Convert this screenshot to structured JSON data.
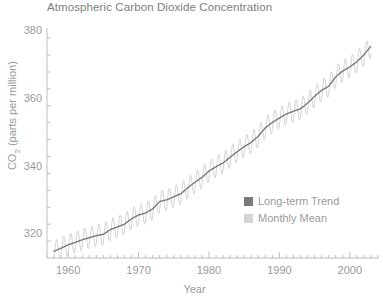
{
  "chart_data": {
    "type": "line",
    "title": "Atmospheric Carbon Dioxide Concentration",
    "xlabel": "Year",
    "ylabel": "CO2 (parts per million)",
    "ylabel_prefix": "CO",
    "ylabel_sub": "2",
    "ylabel_suffix": " (parts per million)",
    "xlim": [
      1957,
      2004
    ],
    "ylim": [
      313,
      381
    ],
    "grid": false,
    "xticks": [
      1960,
      1970,
      1980,
      1990,
      2000
    ],
    "xtick_labels": [
      "1960",
      "1970",
      "1980",
      "1990",
      "2000"
    ],
    "xminor_step": 1,
    "yticks": [
      320,
      340,
      360,
      380
    ],
    "ytick_labels": [
      "320",
      "340",
      "360",
      "380"
    ],
    "yminor_step": 5,
    "legend_position": "center-right-inside",
    "colors": {
      "trend": "#7a7a7a",
      "monthly": "#d4d4d4",
      "axis": "#bdbdbd",
      "text": "#9a9a9a",
      "title": "#7d7d7d",
      "background": "#ffffff"
    },
    "series": [
      {
        "name": "Long-term Trend",
        "swatch_color": "#7a7a7a",
        "x": [
          1958.0,
          1959.0,
          1960.0,
          1961.0,
          1962.0,
          1963.0,
          1964.0,
          1965.0,
          1966.0,
          1967.0,
          1968.0,
          1969.0,
          1970.0,
          1971.0,
          1972.0,
          1973.0,
          1974.0,
          1975.0,
          1976.0,
          1977.0,
          1978.0,
          1979.0,
          1980.0,
          1981.0,
          1982.0,
          1983.0,
          1984.0,
          1985.0,
          1986.0,
          1987.0,
          1988.0,
          1989.0,
          1990.0,
          1991.0,
          1992.0,
          1993.0,
          1994.0,
          1995.0,
          1996.0,
          1997.0,
          1998.0,
          1999.0,
          2000.0,
          2001.0,
          2002.0,
          2003.0
        ],
        "values": [
          315.0,
          315.9,
          316.9,
          317.6,
          318.4,
          319.0,
          319.6,
          320.0,
          321.4,
          322.2,
          323.0,
          324.6,
          325.7,
          326.3,
          327.5,
          329.7,
          330.2,
          331.1,
          332.0,
          333.8,
          335.4,
          336.8,
          338.7,
          340.0,
          341.1,
          342.8,
          344.4,
          345.9,
          347.2,
          349.0,
          351.5,
          353.1,
          354.4,
          355.6,
          356.4,
          357.1,
          358.8,
          360.8,
          362.6,
          363.8,
          366.6,
          368.3,
          369.5,
          371.0,
          373.1,
          375.6
        ]
      },
      {
        "name": "Monthly Mean",
        "swatch_color": "#d4d4d4",
        "seasonal_amplitude_ppm": 3.2,
        "description": "Monthly mean values oscillate seasonally around the long-term trend, peaking in May and troughing in September/October."
      }
    ],
    "legend": [
      {
        "label": "Long-term Trend",
        "color": "#7a7a7a"
      },
      {
        "label": "Monthly Mean",
        "color": "#d4d4d4"
      }
    ]
  }
}
